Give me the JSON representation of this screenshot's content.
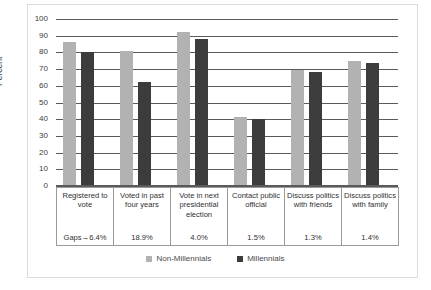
{
  "chart_data": {
    "type": "bar",
    "title": "",
    "xlabel": "",
    "ylabel": "Percent",
    "ylim": [
      0,
      100
    ],
    "ytick_step": 10,
    "yticks": [
      100,
      90,
      80,
      70,
      60,
      50,
      40,
      30,
      20,
      10,
      0
    ],
    "grid": true,
    "legend_position": "bottom",
    "categories": [
      "Registered to vote",
      "Voted in past four years",
      "Vote in next presidential election",
      "Contact public official",
      "Discuss politics with friends",
      "Discuss politics with family"
    ],
    "gap_labels": [
      "Gaps→6.4%",
      "18.9%",
      "4.0%",
      "1.5%",
      "1.3%",
      "1.4%"
    ],
    "series": [
      {
        "name": "Non-Millennials",
        "color": "#b2b2b2",
        "values": [
          86.4,
          80.9,
          92.0,
          41.5,
          69.3,
          74.9
        ]
      },
      {
        "name": "Millennials",
        "color": "#3c3c3c",
        "values": [
          80.0,
          62.0,
          88.0,
          40.0,
          68.0,
          73.5
        ]
      }
    ]
  },
  "axis": {
    "ylabel": "Percent"
  }
}
